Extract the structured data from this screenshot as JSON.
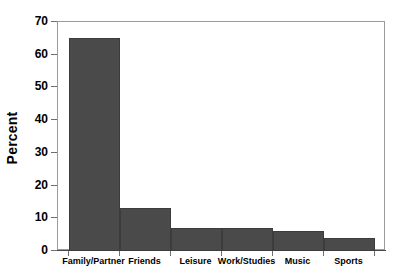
{
  "chart_data": {
    "type": "bar",
    "title": "",
    "xlabel": "",
    "ylabel": "Percent",
    "categories": [
      "Family/Partner",
      "Friends",
      "Leisure",
      "Work/Studies",
      "Music",
      "Sports"
    ],
    "values": [
      65,
      13,
      7,
      7,
      6,
      4
    ],
    "ylim": [
      0,
      70
    ],
    "ytick_labels": [
      "0",
      "10",
      "20",
      "30",
      "40",
      "50",
      "60",
      "70"
    ],
    "ytick_values": [
      0,
      10,
      20,
      30,
      40,
      50,
      60,
      70
    ],
    "grid": false,
    "legend": false,
    "bar_color": "#4a4a4a",
    "bar_edge_color": "#3c3c3c",
    "axis_color": "#6f6f6f",
    "frame_color": "#9a9a9a",
    "background": "#ffffff",
    "bars_contiguous": true
  }
}
